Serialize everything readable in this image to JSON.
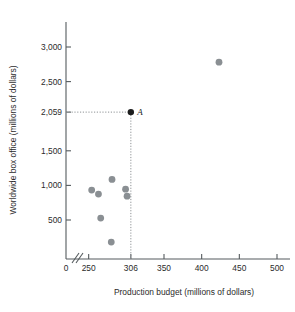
{
  "chart_data": {
    "type": "scatter",
    "title": "",
    "xlabel": "Production budget (millions of dollars)",
    "ylabel": "Worldwide box office (millions of dollars)",
    "xlim": [
      230,
      510
    ],
    "ylim": [
      0,
      3150
    ],
    "x_ticks": [
      0,
      250,
      306,
      350,
      400,
      450,
      500
    ],
    "x_tick_labels": [
      "0",
      "250",
      "306",
      "350",
      "400",
      "450",
      "500"
    ],
    "y_ticks": [
      500,
      1000,
      1500,
      2059,
      2500,
      3000
    ],
    "y_tick_labels": [
      "500",
      "1,000",
      "1,500",
      "2,059",
      "2,500",
      "3,000"
    ],
    "axis_break": true,
    "grid": false,
    "legend": "none",
    "points": [
      {
        "x": 254,
        "y": 932,
        "label": "",
        "highlight": false
      },
      {
        "x": 263,
        "y": 874,
        "label": "",
        "highlight": false
      },
      {
        "x": 266,
        "y": 528,
        "label": "",
        "highlight": false
      },
      {
        "x": 280,
        "y": 181,
        "label": "",
        "highlight": false
      },
      {
        "x": 281,
        "y": 1087,
        "label": "",
        "highlight": false
      },
      {
        "x": 299,
        "y": 946,
        "label": "",
        "highlight": false
      },
      {
        "x": 301,
        "y": 845,
        "label": "",
        "highlight": false
      },
      {
        "x": 306,
        "y": 2059,
        "label": "A",
        "highlight": true
      },
      {
        "x": 423,
        "y": 2780,
        "label": "",
        "highlight": false
      }
    ],
    "annotations": [
      {
        "name": "point-a-guides",
        "x": 306,
        "y": 2059,
        "type": "dotted-crosshair"
      }
    ],
    "colors": {
      "point": "#8a8f93",
      "point_highlight": "#1d1d1d",
      "axis": "#555b5e",
      "guide": "#8e9295",
      "text": "#2b2b2b",
      "background": "#ffffff"
    }
  }
}
